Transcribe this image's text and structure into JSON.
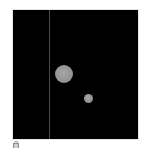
{
  "image": {
    "background": "#000000",
    "frame_border": "#e6e6e6",
    "page_background": "#ffffff"
  },
  "features": {
    "vertical_line": {
      "color": "#4a4a4a"
    },
    "blobs": [
      {
        "name": "large-blob",
        "color": "#999999"
      },
      {
        "name": "small-blob",
        "color": "#999999"
      }
    ]
  },
  "icons": {
    "corner": "lock-icon"
  }
}
